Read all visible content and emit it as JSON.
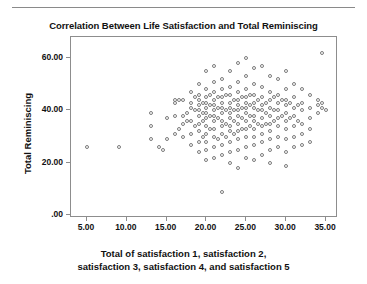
{
  "chart_data": {
    "type": "scatter",
    "title": "Correlation Between Life Satisfaction and Total Reminiscing",
    "xlabel_line1": "Total of satisfaction 1, satisfaction 2,",
    "xlabel_line2": "satisfaction 3, satisfaction 4, and satisfaction 5",
    "ylabel": "Total Reminiscing",
    "xlim": [
      3.0,
      36.5
    ],
    "ylim": [
      -1.0,
      68.0
    ],
    "xticks": [
      5,
      10,
      15,
      20,
      25,
      30,
      35
    ],
    "xticklabels": [
      "5.00",
      "10.00",
      "15.00",
      "20.00",
      "25.00",
      "30.00",
      "35.00"
    ],
    "yticks": [
      0,
      20,
      40,
      60
    ],
    "yticklabels": [
      ".00",
      "20.00",
      "40.00",
      "60.00"
    ],
    "grid": false,
    "legend": null,
    "marker": "open-circle",
    "marker_color": "#7b7b7b",
    "frame_color": "#8d8d8d",
    "points": [
      [
        5.0,
        26.0
      ],
      [
        9.0,
        26.0
      ],
      [
        13.0,
        34.0
      ],
      [
        13.0,
        39.0
      ],
      [
        13.0,
        29.0
      ],
      [
        14.0,
        26.0
      ],
      [
        14.5,
        25.0
      ],
      [
        15.0,
        37.0
      ],
      [
        15.0,
        29.0
      ],
      [
        16.0,
        44.0
      ],
      [
        16.0,
        43.0
      ],
      [
        16.0,
        38.0
      ],
      [
        16.0,
        31.0
      ],
      [
        16.5,
        44.0
      ],
      [
        16.5,
        33.0
      ],
      [
        17.0,
        35.0
      ],
      [
        17.0,
        44.0
      ],
      [
        17.0,
        38.0
      ],
      [
        17.0,
        30.0
      ],
      [
        17.5,
        39.0
      ],
      [
        17.5,
        36.0
      ],
      [
        18.0,
        47.0
      ],
      [
        18.0,
        41.0
      ],
      [
        18.0,
        43.0
      ],
      [
        18.0,
        36.0
      ],
      [
        18.0,
        31.0
      ],
      [
        18.0,
        27.0
      ],
      [
        18.5,
        45.0
      ],
      [
        18.5,
        40.0
      ],
      [
        18.5,
        34.0
      ],
      [
        19.0,
        50.0
      ],
      [
        19.0,
        46.0
      ],
      [
        19.0,
        44.0
      ],
      [
        19.0,
        42.0
      ],
      [
        19.0,
        40.0
      ],
      [
        19.0,
        38.0
      ],
      [
        19.0,
        35.0
      ],
      [
        19.0,
        32.0
      ],
      [
        19.0,
        28.0
      ],
      [
        19.0,
        24.0
      ],
      [
        19.5,
        43.0
      ],
      [
        19.5,
        39.0
      ],
      [
        19.5,
        36.0
      ],
      [
        19.5,
        30.0
      ],
      [
        20.0,
        55.0
      ],
      [
        20.0,
        48.0
      ],
      [
        20.0,
        45.0
      ],
      [
        20.0,
        43.0
      ],
      [
        20.0,
        41.0
      ],
      [
        20.0,
        39.0
      ],
      [
        20.0,
        37.0
      ],
      [
        20.0,
        34.0
      ],
      [
        20.0,
        31.0
      ],
      [
        20.0,
        28.0
      ],
      [
        20.0,
        25.0
      ],
      [
        20.0,
        21.0
      ],
      [
        20.5,
        46.0
      ],
      [
        20.5,
        42.0
      ],
      [
        20.5,
        38.0
      ],
      [
        20.5,
        33.0
      ],
      [
        21.0,
        57.0
      ],
      [
        21.0,
        51.0
      ],
      [
        21.0,
        47.0
      ],
      [
        21.0,
        44.0
      ],
      [
        21.0,
        42.0
      ],
      [
        21.0,
        40.0
      ],
      [
        21.0,
        38.0
      ],
      [
        21.0,
        36.0
      ],
      [
        21.0,
        33.0
      ],
      [
        21.0,
        30.0
      ],
      [
        21.0,
        26.0
      ],
      [
        21.0,
        22.0
      ],
      [
        21.5,
        45.0
      ],
      [
        21.5,
        41.0
      ],
      [
        21.5,
        37.0
      ],
      [
        21.5,
        29.0
      ],
      [
        22.0,
        52.0
      ],
      [
        22.0,
        48.0
      ],
      [
        22.0,
        45.0
      ],
      [
        22.0,
        43.0
      ],
      [
        22.0,
        41.0
      ],
      [
        22.0,
        39.0
      ],
      [
        22.0,
        36.0
      ],
      [
        22.0,
        34.0
      ],
      [
        22.0,
        31.0
      ],
      [
        22.0,
        27.0
      ],
      [
        22.0,
        23.0
      ],
      [
        22.0,
        9.0
      ],
      [
        22.5,
        46.0
      ],
      [
        22.5,
        40.0
      ],
      [
        22.5,
        35.0
      ],
      [
        22.5,
        30.0
      ],
      [
        23.0,
        55.0
      ],
      [
        23.0,
        49.0
      ],
      [
        23.0,
        46.0
      ],
      [
        23.0,
        43.0
      ],
      [
        23.0,
        41.0
      ],
      [
        23.0,
        39.0
      ],
      [
        23.0,
        37.0
      ],
      [
        23.0,
        34.0
      ],
      [
        23.0,
        32.0
      ],
      [
        23.0,
        28.0
      ],
      [
        23.0,
        24.0
      ],
      [
        23.0,
        20.0
      ],
      [
        23.5,
        44.0
      ],
      [
        23.5,
        40.0
      ],
      [
        23.5,
        36.0
      ],
      [
        23.5,
        31.0
      ],
      [
        24.0,
        58.0
      ],
      [
        24.0,
        51.0
      ],
      [
        24.0,
        47.0
      ],
      [
        24.0,
        44.0
      ],
      [
        24.0,
        42.0
      ],
      [
        24.0,
        40.0
      ],
      [
        24.0,
        38.0
      ],
      [
        24.0,
        35.0
      ],
      [
        24.0,
        32.0
      ],
      [
        24.0,
        29.0
      ],
      [
        24.0,
        25.0
      ],
      [
        24.0,
        18.0
      ],
      [
        24.5,
        45.0
      ],
      [
        24.5,
        41.0
      ],
      [
        24.5,
        37.0
      ],
      [
        24.5,
        33.0
      ],
      [
        25.0,
        60.0
      ],
      [
        25.0,
        53.0
      ],
      [
        25.0,
        48.0
      ],
      [
        25.0,
        45.0
      ],
      [
        25.0,
        43.0
      ],
      [
        25.0,
        41.0
      ],
      [
        25.0,
        39.0
      ],
      [
        25.0,
        36.0
      ],
      [
        25.0,
        33.0
      ],
      [
        25.0,
        30.0
      ],
      [
        25.0,
        26.0
      ],
      [
        25.0,
        22.0
      ],
      [
        25.5,
        46.0
      ],
      [
        25.5,
        42.0
      ],
      [
        25.5,
        38.0
      ],
      [
        25.5,
        34.0
      ],
      [
        26.0,
        56.0
      ],
      [
        26.0,
        50.0
      ],
      [
        26.0,
        46.0
      ],
      [
        26.0,
        43.0
      ],
      [
        26.0,
        41.0
      ],
      [
        26.0,
        38.0
      ],
      [
        26.0,
        36.0
      ],
      [
        26.0,
        33.0
      ],
      [
        26.0,
        30.0
      ],
      [
        26.0,
        27.0
      ],
      [
        26.0,
        21.0
      ],
      [
        26.5,
        44.0
      ],
      [
        26.5,
        40.0
      ],
      [
        26.5,
        35.0
      ],
      [
        27.0,
        57.0
      ],
      [
        27.0,
        49.0
      ],
      [
        27.0,
        45.0
      ],
      [
        27.0,
        42.0
      ],
      [
        27.0,
        40.0
      ],
      [
        27.0,
        37.0
      ],
      [
        27.0,
        34.0
      ],
      [
        27.0,
        31.0
      ],
      [
        27.0,
        28.0
      ],
      [
        27.0,
        23.0
      ],
      [
        27.5,
        43.0
      ],
      [
        27.5,
        39.0
      ],
      [
        27.5,
        35.0
      ],
      [
        28.0,
        53.0
      ],
      [
        28.0,
        47.0
      ],
      [
        28.0,
        44.0
      ],
      [
        28.0,
        41.0
      ],
      [
        28.0,
        38.0
      ],
      [
        28.0,
        35.0
      ],
      [
        28.0,
        32.0
      ],
      [
        28.0,
        29.0
      ],
      [
        28.0,
        25.0
      ],
      [
        28.0,
        20.0
      ],
      [
        28.5,
        45.0
      ],
      [
        28.5,
        40.0
      ],
      [
        28.5,
        36.0
      ],
      [
        29.0,
        52.0
      ],
      [
        29.0,
        46.0
      ],
      [
        29.0,
        43.0
      ],
      [
        29.0,
        40.0
      ],
      [
        29.0,
        37.0
      ],
      [
        29.0,
        34.0
      ],
      [
        29.0,
        30.0
      ],
      [
        29.0,
        26.0
      ],
      [
        29.5,
        44.0
      ],
      [
        29.5,
        38.0
      ],
      [
        30.0,
        55.0
      ],
      [
        30.0,
        48.0
      ],
      [
        30.0,
        44.0
      ],
      [
        30.0,
        42.0
      ],
      [
        30.0,
        39.0
      ],
      [
        30.0,
        36.0
      ],
      [
        30.0,
        33.0
      ],
      [
        30.0,
        29.0
      ],
      [
        30.0,
        24.0
      ],
      [
        30.0,
        19.0
      ],
      [
        30.5,
        43.0
      ],
      [
        30.5,
        37.0
      ],
      [
        31.0,
        50.0
      ],
      [
        31.0,
        45.0
      ],
      [
        31.0,
        41.0
      ],
      [
        31.0,
        38.0
      ],
      [
        31.0,
        34.0
      ],
      [
        31.0,
        30.0
      ],
      [
        31.0,
        26.0
      ],
      [
        31.5,
        42.0
      ],
      [
        31.5,
        36.0
      ],
      [
        32.0,
        48.0
      ],
      [
        32.0,
        43.0
      ],
      [
        32.0,
        40.0
      ],
      [
        32.0,
        35.0
      ],
      [
        32.0,
        31.0
      ],
      [
        32.0,
        27.0
      ],
      [
        33.0,
        46.0
      ],
      [
        33.0,
        41.0
      ],
      [
        33.0,
        37.0
      ],
      [
        33.0,
        33.0
      ],
      [
        33.0,
        28.0
      ],
      [
        34.0,
        44.0
      ],
      [
        34.0,
        42.0
      ],
      [
        34.0,
        39.0
      ],
      [
        34.5,
        62.0
      ],
      [
        34.5,
        43.0
      ],
      [
        34.5,
        41.0
      ],
      [
        35.0,
        40.0
      ]
    ]
  }
}
